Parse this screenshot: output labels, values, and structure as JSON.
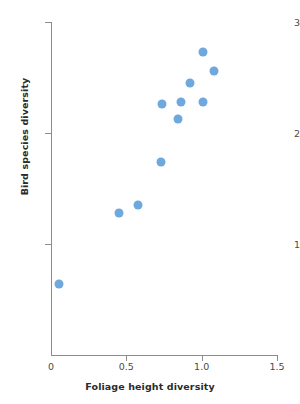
{
  "chart_data": {
    "type": "scatter",
    "title": "",
    "xlabel": "Foliage height diversity",
    "ylabel": "Bird species diversity",
    "xlim": [
      0,
      1.5
    ],
    "ylim": [
      0,
      3
    ],
    "xticks": [
      0,
      0.5,
      1.0,
      1.5
    ],
    "xtick_labels": [
      "0",
      "0.5",
      "1.0",
      "1.5"
    ],
    "yticks": [
      1,
      2,
      3
    ],
    "ytick_labels": [
      "1",
      "2",
      "3"
    ],
    "grid": false,
    "legend": null,
    "marker": {
      "shape": "circle",
      "color": "#6fa8dc",
      "size_px": 9
    },
    "series": [
      {
        "name": "Bird species diversity vs foliage height diversity",
        "points": [
          {
            "x": 0.05,
            "y": 0.64
          },
          {
            "x": 0.45,
            "y": 1.28
          },
          {
            "x": 0.58,
            "y": 1.35
          },
          {
            "x": 0.73,
            "y": 1.74
          },
          {
            "x": 0.74,
            "y": 2.26
          },
          {
            "x": 0.84,
            "y": 2.13
          },
          {
            "x": 0.86,
            "y": 2.28
          },
          {
            "x": 0.92,
            "y": 2.45
          },
          {
            "x": 1.01,
            "y": 2.73
          },
          {
            "x": 1.01,
            "y": 2.28
          },
          {
            "x": 1.08,
            "y": 2.56
          }
        ]
      }
    ]
  },
  "axis_colors": {
    "line": "#8c8c8c",
    "tick_text": "#4a4a4a",
    "title_text": "#2b2b2b",
    "background": "#ffffff"
  }
}
